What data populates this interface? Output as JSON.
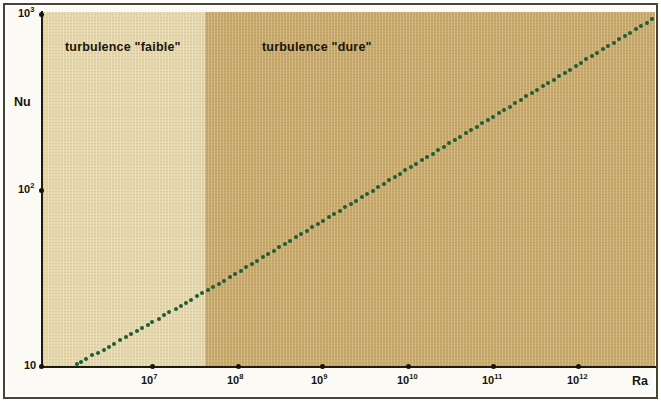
{
  "figure": {
    "background_color": "#fbfaf5",
    "frame_color": "#4a4334"
  },
  "annotations": {
    "faible": "turbulence \"faible\"",
    "dure": "turbulence \"dure\""
  },
  "axes": {
    "y_name": "Nu",
    "x_name": "Ra",
    "y_ticks": [
      {
        "label": "10",
        "sup": "3",
        "y": 14
      },
      {
        "label": "10",
        "sup": "2",
        "y": 190
      },
      {
        "label": "10",
        "sup": "",
        "y": 366
      }
    ],
    "x_ticks": [
      {
        "label": "10",
        "sup": "7",
        "x": 152
      },
      {
        "label": "10",
        "sup": "8",
        "x": 238
      },
      {
        "label": "10",
        "sup": "9",
        "x": 322
      },
      {
        "label": "10",
        "sup": "10",
        "x": 408
      },
      {
        "label": "10",
        "sup": "11",
        "x": 493
      },
      {
        "label": "10",
        "sup": "12",
        "x": 578
      }
    ]
  },
  "regions": [
    {
      "name": "turbulence faible",
      "color": "#e4d6a9",
      "x_start": 42,
      "x_end": 205
    },
    {
      "name": "turbulence dure",
      "color": "#c9a96a",
      "x_start": 205,
      "x_end": 655
    }
  ],
  "chart_data": {
    "type": "scatter",
    "title": "",
    "xlabel": "Ra",
    "ylabel": "Nu",
    "xscale": "log",
    "yscale": "log",
    "xlim": [
      1000000,
      40000000000000
    ],
    "ylim": [
      10,
      1000
    ],
    "grid": false,
    "legend": null,
    "marker_color": "#1d5c34",
    "annotations": [
      {
        "text": "turbulence \"faible\"",
        "x": 3000000,
        "y": 700
      },
      {
        "text": "turbulence \"dure\"",
        "x": 200000000,
        "y": 700
      }
    ],
    "region_boundary_x": 300000000,
    "series": [
      {
        "name": "Nu(Ra)",
        "points": [
          [
            1300000,
            10.3
          ],
          [
            1450000,
            10.6
          ],
          [
            1700000,
            11.0
          ],
          [
            2000000,
            11.5
          ],
          [
            2300000,
            11.9
          ],
          [
            2700000,
            12.4
          ],
          [
            3100000,
            12.9
          ],
          [
            3600000,
            13.4
          ],
          [
            4200000,
            14.0
          ],
          [
            4900000,
            14.6
          ],
          [
            5700000,
            15.2
          ],
          [
            6600000,
            15.8
          ],
          [
            7700000,
            16.5
          ],
          [
            8900000,
            17.2
          ],
          [
            10000000,
            17.8
          ],
          [
            12000000,
            18.6
          ],
          [
            14000000,
            19.4
          ],
          [
            16000000,
            20.2
          ],
          [
            19000000,
            21.1
          ],
          [
            22000000,
            22.0
          ],
          [
            25000000,
            22.8
          ],
          [
            29000000,
            23.8
          ],
          [
            34000000,
            24.9
          ],
          [
            39000000,
            25.9
          ],
          [
            45000000,
            27.0
          ],
          [
            52000000,
            28.1
          ],
          [
            61000000,
            29.4
          ],
          [
            70000000,
            30.6
          ],
          [
            82000000,
            32.0
          ],
          [
            95000000,
            33.4
          ],
          [
            110000000,
            34.8
          ],
          [
            128000000,
            36.4
          ],
          [
            148000000,
            37.9
          ],
          [
            172000000,
            39.6
          ],
          [
            200000000,
            41.4
          ],
          [
            232000000,
            43.2
          ],
          [
            269000000,
            45.2
          ],
          [
            312000000,
            47.2
          ],
          [
            362000000,
            49.3
          ],
          [
            420000000,
            51.5
          ],
          [
            487000000,
            53.8
          ],
          [
            565000000,
            56.2
          ],
          [
            655000000,
            58.7
          ],
          [
            760000000,
            61.3
          ],
          [
            881000000,
            64.1
          ],
          [
            1022000000,
            66.9
          ],
          [
            1185000000,
            69.9
          ],
          [
            1375000000,
            73.1
          ],
          [
            1594000000,
            76.3
          ],
          [
            1849000000,
            79.8
          ],
          [
            2144000000,
            83.3
          ],
          [
            2487000000,
            87.1
          ],
          [
            2884000000,
            91.0
          ],
          [
            3345000000,
            95.1
          ],
          [
            3880000000,
            99.3
          ],
          [
            4500000000,
            103.8
          ],
          [
            5219000000,
            108.5
          ],
          [
            6053000000,
            113.3
          ],
          [
            7021000000,
            118.4
          ],
          [
            8143000000,
            123.7
          ],
          [
            9444000000,
            129.3
          ],
          [
            10953000000,
            135.1
          ],
          [
            12703000000,
            141.2
          ],
          [
            14733000000,
            147.5
          ],
          [
            17087000000,
            154.1
          ],
          [
            19818000000,
            161.1
          ],
          [
            22984000000,
            168.3
          ],
          [
            26657000000,
            175.9
          ],
          [
            30917000000,
            183.8
          ],
          [
            35857000000,
            192.1
          ],
          [
            41588000000,
            200.7
          ],
          [
            48234000000,
            209.7
          ],
          [
            55941000000,
            219.1
          ],
          [
            64882000000,
            229.0
          ],
          [
            75252000000,
            239.3
          ],
          [
            87279000000,
            250.0
          ],
          [
            101226000000,
            261.3
          ],
          [
            117400000000,
            273.0
          ],
          [
            136160000000,
            285.3
          ],
          [
            157920000000,
            298.1
          ],
          [
            183160000000,
            311.5
          ],
          [
            212430000000,
            325.5
          ],
          [
            246370000000,
            340.1
          ],
          [
            285730000000,
            355.4
          ],
          [
            331380000000,
            371.4
          ],
          [
            384330000000,
            388.1
          ],
          [
            445740000000,
            405.5
          ],
          [
            516960000000,
            423.8
          ],
          [
            599550000000,
            442.8
          ],
          [
            695330000000,
            462.7
          ],
          [
            806420000000,
            483.5
          ],
          [
            935270000000,
            505.2
          ],
          [
            1084700000000,
            527.9
          ],
          [
            1258000000000,
            551.6
          ],
          [
            1459000000000,
            576.4
          ],
          [
            1692000000000,
            602.3
          ],
          [
            1962000000000,
            629.4
          ],
          [
            2276000000000,
            657.7
          ],
          [
            2639000000000,
            687.2
          ],
          [
            3061000000000,
            718.1
          ],
          [
            3550000000000,
            750.4
          ],
          [
            4117000000000,
            784.1
          ],
          [
            4774000000000,
            819.4
          ],
          [
            5537000000000,
            856.2
          ],
          [
            6422000000000,
            894.6
          ],
          [
            7447000000000,
            934.8
          ],
          [
            8637000000000,
            976.8
          ]
        ]
      }
    ]
  }
}
